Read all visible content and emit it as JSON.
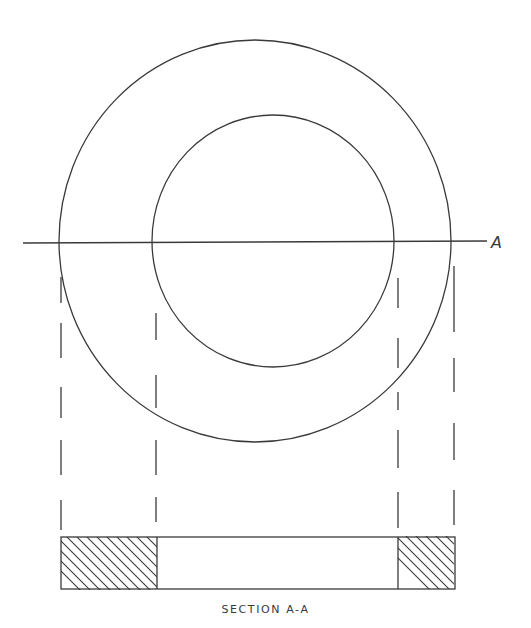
{
  "drawing": {
    "title": "Section A-A",
    "cut_line_label": "A",
    "section_label": "SECTION A-A",
    "views": [
      {
        "name": "plan-view",
        "description": "Annular ring (washer) shown as two concentric circles with cutting-plane line A"
      },
      {
        "name": "section-view",
        "description": "Cross-section A-A with hatched solid material at both ends and open center bore"
      }
    ],
    "colors": {
      "line": "#3a3a3a",
      "background": "#ffffff"
    }
  }
}
